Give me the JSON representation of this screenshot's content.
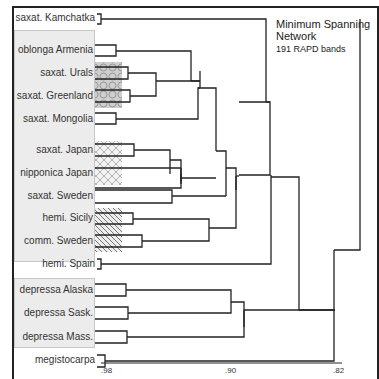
{
  "title": {
    "line1": "Minimum Spanning",
    "line2": "Network",
    "subtitle": "191 RAPD bands"
  },
  "leaves": [
    {
      "label": "saxat. Kamchatka",
      "y": 19
    },
    {
      "label": "oblonga Armenia",
      "y": 51
    },
    {
      "label": "saxat. Urals",
      "y": 73
    },
    {
      "label": "saxat. Greenland",
      "y": 96
    },
    {
      "label": "saxat. Mongolia",
      "y": 119
    },
    {
      "label": "saxat. Japan",
      "y": 150
    },
    {
      "label": "nipponica Japan",
      "y": 174
    },
    {
      "label": "saxat. Sweden",
      "y": 196
    },
    {
      "label": "hemi. Sicily",
      "y": 219
    },
    {
      "label": "comm. Sweden",
      "y": 241
    },
    {
      "label": "hemi. Spain",
      "y": 264
    },
    {
      "label": "depressa Alaska",
      "y": 290
    },
    {
      "label": "depressa Sask.",
      "y": 313
    },
    {
      "label": "depressa Mass.",
      "y": 337
    },
    {
      "label": "megistocarpa",
      "y": 361
    }
  ],
  "axis": {
    "ticks": [
      ".98",
      ".90",
      ".82"
    ]
  },
  "legend_patterns": [
    "hexagon",
    "crosshatch",
    "diagonal"
  ]
}
